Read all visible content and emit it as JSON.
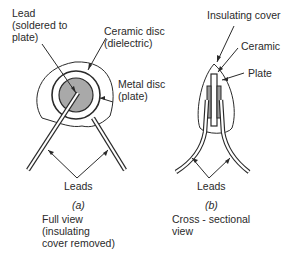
{
  "figure_a": {
    "labels": {
      "lead": "Lead",
      "lead_line2": "(soldered to",
      "lead_line3": "plate)",
      "ceramic": "Ceramic disc",
      "ceramic_line2": "(dielectric)",
      "metal": "Metal disc",
      "metal_line2": "(plate)",
      "leads": "Leads"
    },
    "caption_letter": "(a)",
    "caption_line1": "Full view",
    "caption_line2": "(insulating",
    "caption_line3": "cover removed)"
  },
  "figure_b": {
    "labels": {
      "insulating_cover": "Insulating cover",
      "ceramic": "Ceramic",
      "plate": "Plate",
      "leads": "Leads"
    },
    "caption_letter": "(b)",
    "caption_line1": "Cross - sectional",
    "caption_line2": "view"
  },
  "colors": {
    "line": "#2a2a2a",
    "metal_fill": "#a9a9a9",
    "background": "#ffffff"
  }
}
